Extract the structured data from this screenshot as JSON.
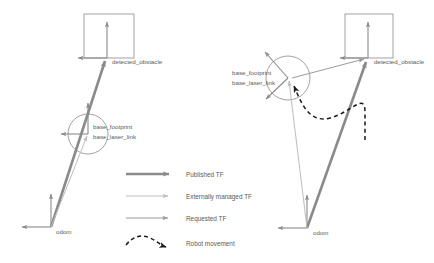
{
  "diagram": {
    "colors": {
      "published_tf": "#8a8a8a",
      "externally_managed_tf": "#b8b8b8",
      "requested_tf": "#9a9a9a",
      "robot_movement": "#1a1a1a",
      "axis": "#8a8a8a",
      "text": "#5a5a5a",
      "background": "#ffffff"
    },
    "panels": [
      {
        "id": "left-panel",
        "name": "before-movement",
        "frames": [
          {
            "name": "detected_obstacle",
            "label": "detected_obstacle"
          },
          {
            "name": "base_footprint",
            "label": "base_footprint"
          },
          {
            "name": "base_laser_link",
            "label": "base_laser_link"
          },
          {
            "name": "odom",
            "label": "odom"
          }
        ]
      },
      {
        "id": "right-panel",
        "name": "after-movement",
        "frames": [
          {
            "name": "detected_obstacle",
            "label": "detected_obstacle"
          },
          {
            "name": "base_footprint",
            "label": "base_footprint"
          },
          {
            "name": "base_laser_link",
            "label": "base_laser_link"
          },
          {
            "name": "odom",
            "label": "odom"
          }
        ]
      }
    ],
    "legend": {
      "name": "legend",
      "items": [
        {
          "key": "published-tf",
          "label": "Published TF",
          "style": "solid-thick",
          "color": "#8a8a8a"
        },
        {
          "key": "externally-managed-tf",
          "label": "Externally managed TF",
          "style": "solid-thin-light",
          "color": "#bdbdbd"
        },
        {
          "key": "requested-tf",
          "label": "Requested TF",
          "style": "solid-thin",
          "color": "#9a9a9a"
        },
        {
          "key": "robot-movement",
          "label": "Robot movement",
          "style": "dashed-curve",
          "color": "#1a1a1a"
        }
      ]
    }
  }
}
